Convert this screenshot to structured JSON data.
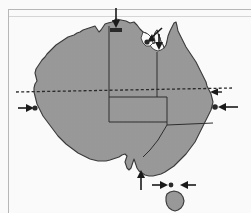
{
  "document": {
    "figure_title": "Map of Australia with location markers",
    "page_frame": {
      "has_top_rule": true,
      "has_left_rule": true,
      "rule_color": "#b9b9b9"
    }
  },
  "map": {
    "region_name": "Australia",
    "land_fill_color": "#9a9a9a",
    "coastline_color": "#3a3a3a",
    "border_color": "#2e2e2e",
    "background_color": "#fdfdfd",
    "islands": [
      {
        "name": "mainland-australia"
      },
      {
        "name": "tasmania"
      }
    ],
    "internal_borders": [
      {
        "name": "wa-nt-sa-border"
      },
      {
        "name": "nt-qld-border"
      },
      {
        "name": "nt-sa-border"
      },
      {
        "name": "qld-nsw-border"
      },
      {
        "name": "sa-nsw-vic-border"
      },
      {
        "name": "nsw-vic-border"
      }
    ],
    "latitude_line": {
      "name": "tropic-of-capricorn",
      "style": "dashed",
      "color": "#2a2a2a",
      "label": ""
    }
  },
  "markers": [
    {
      "id": "marker-1",
      "name": "north-coast-marker",
      "arrow_direction": "down",
      "label": "",
      "target": "northern-coast"
    },
    {
      "id": "marker-2",
      "name": "gulf-of-carpentaria-marker",
      "arrow_direction": "down-left",
      "label": "",
      "target": "gulf-of-carpentaria"
    },
    {
      "id": "marker-3",
      "name": "cape-york-west-marker",
      "arrow_direction": "down",
      "label": "",
      "target": "gulf-coast"
    },
    {
      "id": "marker-4",
      "name": "west-coast-marker",
      "arrow_direction": "right",
      "label": "",
      "target": "western-coast"
    },
    {
      "id": "marker-5",
      "name": "east-coast-upper-marker",
      "arrow_direction": "left",
      "label": "",
      "target": "eastern-coast-upper"
    },
    {
      "id": "marker-6",
      "name": "east-coast-marker",
      "arrow_direction": "left",
      "label": "",
      "target": "eastern-coast"
    },
    {
      "id": "marker-7",
      "name": "south-coast-marker",
      "arrow_direction": "up",
      "label": "",
      "target": "southern-coast-gulf"
    },
    {
      "id": "marker-8",
      "name": "bass-strait-west-marker",
      "arrow_direction": "right",
      "label": "",
      "target": "bass-strait"
    },
    {
      "id": "marker-9",
      "name": "bass-strait-east-marker",
      "arrow_direction": "left",
      "label": "",
      "target": "bass-strait"
    }
  ]
}
